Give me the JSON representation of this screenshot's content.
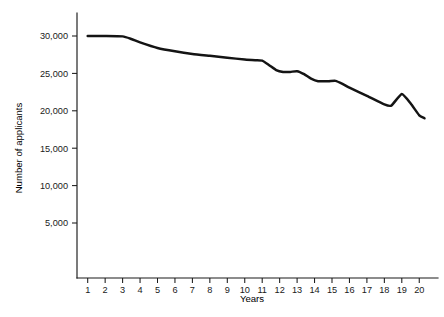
{
  "chart_data": {
    "type": "line",
    "title": "",
    "subtitle": "",
    "xlabel": "Years",
    "ylabel": "Number of applicants",
    "grid": false,
    "legend": "none",
    "xlim": [
      1,
      20
    ],
    "ylim": [
      0,
      31500
    ],
    "x_tick_labels": [
      "1",
      "2",
      "3",
      "4",
      "5",
      "6",
      "7",
      "8",
      "9",
      "10",
      "11",
      "12",
      "13",
      "14",
      "15",
      "16",
      "17",
      "18",
      "19",
      "20"
    ],
    "y_tick_labels": [
      "5,000",
      "10,000",
      "15,000",
      "20,000",
      "25,000",
      "30,000"
    ],
    "y_tick_values": [
      5000,
      10000,
      15000,
      20000,
      25000,
      30000
    ],
    "series": [
      {
        "name": "Number of applicants",
        "color": "#141414",
        "x": [
          1,
          2,
          3,
          3.5,
          4,
          5,
          6,
          7,
          8,
          9,
          10,
          10.6,
          11,
          11.4,
          11.8,
          12.2,
          12.6,
          13,
          13.4,
          13.8,
          14.2,
          14.8,
          15.2,
          15.6,
          16,
          17,
          18,
          18.4,
          19,
          19.5,
          20,
          20.3
        ],
        "values": [
          30000,
          30000,
          29950,
          29600,
          29150,
          28400,
          27950,
          27600,
          27350,
          27100,
          26850,
          26750,
          26700,
          26100,
          25450,
          25200,
          25200,
          25300,
          24900,
          24300,
          23950,
          23950,
          24000,
          23600,
          23100,
          22000,
          20850,
          20700,
          22250,
          21000,
          19400,
          19000
        ]
      }
    ]
  },
  "axis_geometry": {
    "plot_left_px": 77,
    "plot_bottom_px": 278,
    "plot_top_px": 13,
    "plot_right_px": 438,
    "x_first_tick_px": 87.7,
    "x_tick_spacing_px": 17.45,
    "y_value_30000_px": 36,
    "y_px_per_5000": 37.4
  }
}
